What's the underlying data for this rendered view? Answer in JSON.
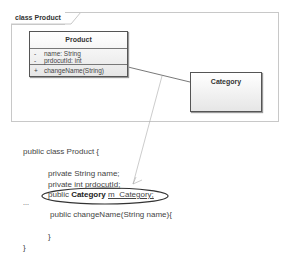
{
  "frame": {
    "label": "class Product"
  },
  "classes": {
    "product": {
      "name": "Product",
      "attributes": [
        {
          "visibility": "-",
          "text": "name: String"
        },
        {
          "visibility": "-",
          "text": "prdocutId: int"
        }
      ],
      "operations": [
        {
          "visibility": "+",
          "text": "changeName(String)"
        }
      ]
    },
    "category": {
      "name": "Category"
    }
  },
  "code": {
    "class_decl": "public class Product {",
    "field1": "private String name;",
    "field2_prefix": "private int ",
    "field2_name": "prdocutId;",
    "field3_prefix": "public ",
    "field3_type": "Category",
    "field3_name": "m_Category;",
    "ellipsis": "...",
    "method": "public changeName(String name){",
    "method_close": "}",
    "class_close": "}"
  },
  "colors": {
    "highlight_ellipse": "#333333",
    "note_line": "#aaaaaa"
  }
}
